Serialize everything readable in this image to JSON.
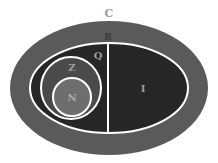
{
  "diagram": {
    "sets": [
      {
        "id": "C",
        "label": "C",
        "name": "complex-numbers",
        "color": "#5a5a5a"
      },
      {
        "id": "R",
        "label": "R",
        "name": "real-numbers",
        "color": "#2a2a2a"
      },
      {
        "id": "Q",
        "label": "Q",
        "name": "rational-numbers",
        "color": "#262626"
      },
      {
        "id": "I",
        "label": "I",
        "name": "irrational-numbers",
        "color": "#222222"
      },
      {
        "id": "Z",
        "label": "Z",
        "name": "integers",
        "color": "#4a4a4a"
      },
      {
        "id": "N",
        "label": "N",
        "name": "natural-numbers",
        "color": "#6e6e6e"
      }
    ],
    "border_color": "#ffffff",
    "label_color": "#9a9a9a"
  }
}
